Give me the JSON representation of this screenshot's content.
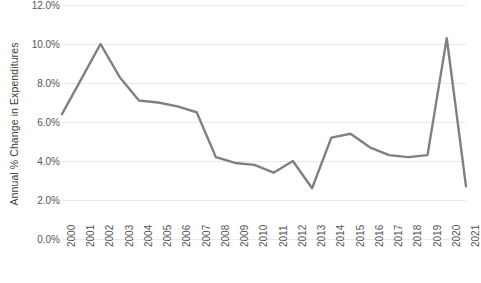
{
  "chart_data": {
    "type": "line",
    "title": "",
    "subtitle": "",
    "xlabel": "",
    "ylabel": "Annual % Change in Expenditures",
    "x": [
      "2000",
      "2001",
      "2002",
      "2003",
      "2004",
      "2005",
      "2006",
      "2007",
      "2008",
      "2009",
      "2010",
      "2011",
      "2012",
      "2013",
      "2014",
      "2015",
      "2016",
      "2017",
      "2018",
      "2019",
      "2020",
      "2021"
    ],
    "categories": [
      "2000",
      "2001",
      "2002",
      "2003",
      "2004",
      "2005",
      "2006",
      "2007",
      "2008",
      "2009",
      "2010",
      "2011",
      "2012",
      "2013",
      "2014",
      "2015",
      "2016",
      "2017",
      "2018",
      "2019",
      "2020",
      "2021"
    ],
    "values": [
      6.4,
      8.2,
      10.0,
      8.3,
      7.1,
      7.0,
      6.8,
      6.5,
      4.2,
      3.9,
      3.8,
      3.4,
      4.0,
      2.6,
      5.2,
      5.4,
      4.7,
      4.3,
      4.2,
      4.3,
      10.3,
      2.7
    ],
    "series": [
      {
        "name": "Annual % Change in Expenditures",
        "color": "#808080",
        "values": [
          6.4,
          8.2,
          10.0,
          8.3,
          7.1,
          7.0,
          6.8,
          6.5,
          4.2,
          3.9,
          3.8,
          3.4,
          4.0,
          2.6,
          5.2,
          5.4,
          4.7,
          4.3,
          4.2,
          4.3,
          10.3,
          2.7
        ]
      }
    ],
    "ylim": [
      0,
      12
    ],
    "ytick_values": [
      0,
      2,
      4,
      6,
      8,
      10,
      12
    ],
    "ytick_labels": [
      "0.0%",
      "2.0%",
      "4.0%",
      "6.0%",
      "8.0%",
      "10.0%",
      "12.0%"
    ],
    "xtick_labels": [
      "2000",
      "2001",
      "2002",
      "2003",
      "2004",
      "2005",
      "2006",
      "2007",
      "2008",
      "2009",
      "2010",
      "2011",
      "2012",
      "2013",
      "2014",
      "2015",
      "2016",
      "2017",
      "2018",
      "2019",
      "2020",
      "2021"
    ],
    "xtick_rotation": -90,
    "grid": "horizontal",
    "legend": "none",
    "line_color": "#808080",
    "gridline_color": "#e8e8e8",
    "markers": false
  }
}
